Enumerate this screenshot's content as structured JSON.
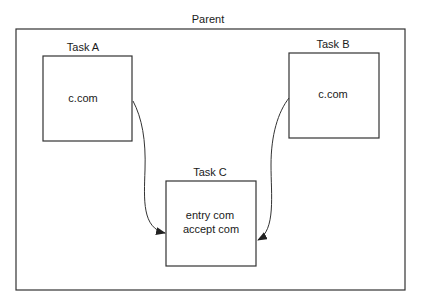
{
  "diagram": {
    "parent": {
      "label": "Parent"
    },
    "tasks": [
      {
        "id": "A",
        "title": "Task A",
        "content": [
          "c.com"
        ]
      },
      {
        "id": "B",
        "title": "Task B",
        "content": [
          "c.com"
        ]
      },
      {
        "id": "C",
        "title": "Task C",
        "content": [
          "entry com",
          "accept com"
        ]
      }
    ],
    "edges": [
      {
        "from": "A",
        "to": "C",
        "style": "curved-arrow"
      },
      {
        "from": "B",
        "to": "C",
        "style": "curved-arrow"
      }
    ],
    "colors": {
      "line": "#333333",
      "text": "#1a1a1a",
      "background": "#ffffff"
    }
  }
}
